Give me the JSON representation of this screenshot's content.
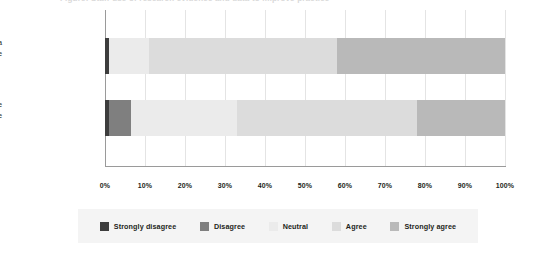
{
  "title": {
    "text": "Figure: Staff use of research evidence and data to improve practice"
  },
  "chart_data": {
    "type": "bar",
    "subtype": "stacked-horizontal-100",
    "title": "",
    "xlabel": "",
    "ylabel": "",
    "xlim": [
      0,
      100
    ],
    "x_tick_labels": [
      "0%",
      "10%",
      "20%",
      "30%",
      "40%",
      "50%",
      "60%",
      "70%",
      "80%",
      "90%",
      "100%"
    ],
    "x_tick_values": [
      0,
      10,
      20,
      30,
      40,
      50,
      60,
      70,
      80,
      90,
      100
    ],
    "grid": true,
    "legend_position": "bottom",
    "categories": [
      "Staff analyse and use data to improve their practice",
      "Staff use research evidence to improve their practice"
    ],
    "category_lines": [
      [
        "Staff analyse and use data",
        "to improve their practice"
      ],
      [
        "Staff use research evidence",
        "to improve their practice"
      ]
    ],
    "series": [
      {
        "name": "Strongly disagree",
        "color": "#3d3d3d",
        "values": [
          1,
          1
        ]
      },
      {
        "name": "Disagree",
        "color": "#7f7f7f",
        "values": [
          0,
          5.5
        ]
      },
      {
        "name": "Neutral",
        "color": "#ebebeb",
        "values": [
          10,
          26.5
        ]
      },
      {
        "name": "Agree",
        "color": "#dcdcdc",
        "values": [
          47,
          45
        ]
      },
      {
        "name": "Strongly agree",
        "color": "#b9b9b9",
        "values": [
          42,
          22
        ]
      }
    ]
  },
  "legend": {
    "items": [
      {
        "label": "Strongly disagree",
        "color": "#3d3d3d"
      },
      {
        "label": "Disagree",
        "color": "#7f7f7f"
      },
      {
        "label": "Neutral",
        "color": "#ebebeb"
      },
      {
        "label": "Agree",
        "color": "#dcdcdc"
      },
      {
        "label": "Strongly agree",
        "color": "#b9b9b9"
      }
    ],
    "background": "#f4f4f4"
  },
  "colors": {
    "axis": "#9a9a9a",
    "grid": "#e4e4e4",
    "text": "#231f20",
    "background": "#ffffff"
  }
}
